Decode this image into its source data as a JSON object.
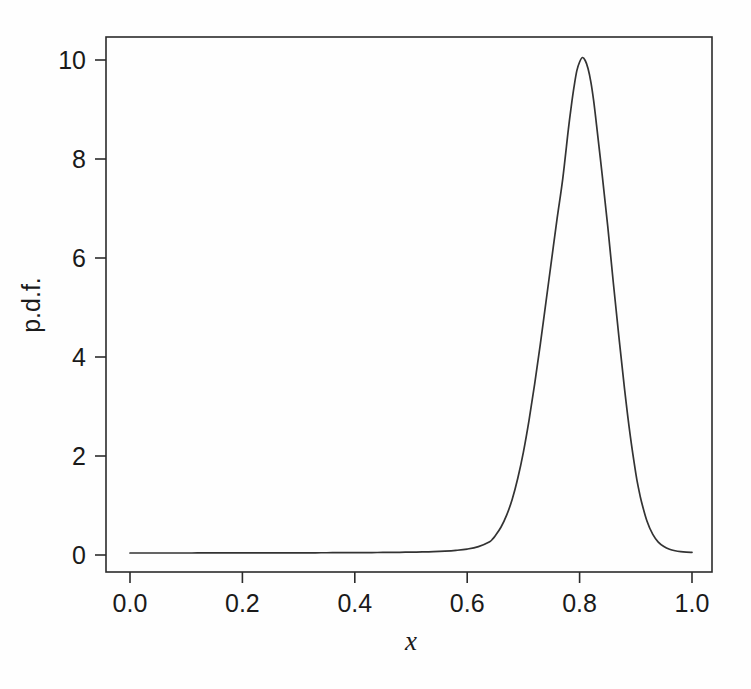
{
  "figure": {
    "background_color": "#fefefe",
    "line_color": "#333333",
    "axis_color": "#2b2b2b",
    "width": 751,
    "height": 689
  },
  "axes": {
    "x_title": "x",
    "y_title": "p.d.f.",
    "x_ticks": [
      "0.0",
      "0.2",
      "0.4",
      "0.6",
      "0.8",
      "1.0"
    ],
    "y_ticks": [
      "0",
      "2",
      "4",
      "6",
      "8",
      "10"
    ]
  },
  "chart_data": {
    "type": "line",
    "title": "",
    "subtitle": "",
    "xlabel": "x",
    "ylabel": "p.d.f.",
    "xlim": [
      0.0,
      1.0
    ],
    "ylim": [
      0.0,
      10.4
    ],
    "grid": false,
    "legend": "none",
    "xticks": [
      0.0,
      0.2,
      0.4,
      0.6,
      0.8,
      1.0
    ],
    "xticklabels": [
      "0.0",
      "0.2",
      "0.4",
      "0.6",
      "0.8",
      "1.0"
    ],
    "yticks": [
      0,
      2,
      4,
      6,
      8,
      10
    ],
    "yticklabels": [
      "0",
      "2",
      "4",
      "6",
      "8",
      "10"
    ],
    "peak": {
      "x": 0.805,
      "y": 10.05
    },
    "baseline_level": 0.04,
    "series": [
      {
        "name": "p.d.f.",
        "x": [
          0.0,
          0.02,
          0.04,
          0.06,
          0.08,
          0.1,
          0.12,
          0.14,
          0.16,
          0.18,
          0.2,
          0.22,
          0.24,
          0.26,
          0.28,
          0.3,
          0.32,
          0.34,
          0.36,
          0.38,
          0.4,
          0.42,
          0.44,
          0.46,
          0.48,
          0.5,
          0.52,
          0.54,
          0.56,
          0.58,
          0.6,
          0.62,
          0.64,
          0.645,
          0.65,
          0.66,
          0.67,
          0.68,
          0.69,
          0.7,
          0.71,
          0.72,
          0.73,
          0.74,
          0.75,
          0.76,
          0.77,
          0.78,
          0.785,
          0.79,
          0.795,
          0.8,
          0.805,
          0.81,
          0.815,
          0.82,
          0.825,
          0.83,
          0.84,
          0.85,
          0.86,
          0.87,
          0.88,
          0.89,
          0.9,
          0.905,
          0.91,
          0.92,
          0.93,
          0.94,
          0.95,
          0.96,
          0.97,
          0.98,
          0.99,
          1.0
        ],
        "y": [
          0.04,
          0.04,
          0.04,
          0.04,
          0.04,
          0.04,
          0.041,
          0.041,
          0.041,
          0.041,
          0.042,
          0.042,
          0.042,
          0.043,
          0.043,
          0.044,
          0.044,
          0.045,
          0.046,
          0.047,
          0.048,
          0.049,
          0.051,
          0.053,
          0.055,
          0.058,
          0.062,
          0.068,
          0.078,
          0.094,
          0.12,
          0.17,
          0.27,
          0.32,
          0.39,
          0.56,
          0.8,
          1.12,
          1.55,
          2.08,
          2.72,
          3.45,
          4.25,
          5.1,
          5.95,
          6.8,
          7.6,
          8.6,
          9.05,
          9.45,
          9.78,
          9.96,
          10.05,
          9.99,
          9.83,
          9.56,
          9.18,
          8.7,
          7.7,
          6.65,
          5.5,
          4.4,
          3.35,
          2.42,
          1.65,
          1.34,
          1.08,
          0.68,
          0.42,
          0.26,
          0.17,
          0.115,
          0.085,
          0.068,
          0.058,
          0.052
        ]
      }
    ]
  },
  "geometry": {
    "plot_left_px": 106,
    "plot_right_px": 712,
    "plot_top_px": 37,
    "plot_bottom_px": 572,
    "x0_px": 130,
    "x1_px": 692,
    "y0_px": 555,
    "y10_px": 60
  }
}
